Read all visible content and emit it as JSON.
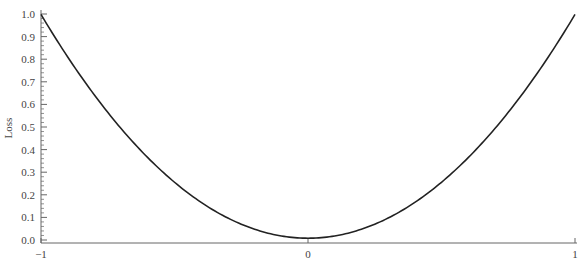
{
  "chart_data": {
    "type": "line",
    "title": "",
    "xlabel": "",
    "ylabel": "Loss",
    "xlim": [
      -1,
      1
    ],
    "ylim": [
      0.0,
      1.0
    ],
    "x_ticks": [
      "−1",
      "0",
      "1"
    ],
    "x_tick_values": [
      -1,
      0,
      1
    ],
    "y_ticks": [
      "0.0",
      "0.1",
      "0.2",
      "0.3",
      "0.4",
      "0.5",
      "0.6",
      "0.7",
      "0.8",
      "0.9",
      "1.0"
    ],
    "y_tick_values": [
      0.0,
      0.1,
      0.2,
      0.3,
      0.4,
      0.5,
      0.6,
      0.7,
      0.8,
      0.9,
      1.0
    ],
    "y_minor_ticks_per_major": 5,
    "grid": false,
    "legend": null,
    "series": [
      {
        "name": "Loss",
        "color": "#222222",
        "function": "x^2",
        "x": [
          -1.0,
          -0.9,
          -0.8,
          -0.7,
          -0.6,
          -0.5,
          -0.4,
          -0.3,
          -0.2,
          -0.1,
          0.0,
          0.1,
          0.2,
          0.3,
          0.4,
          0.5,
          0.6,
          0.7,
          0.8,
          0.9,
          1.0
        ],
        "y": [
          1.0,
          0.81,
          0.64,
          0.49,
          0.36,
          0.25,
          0.16,
          0.09,
          0.04,
          0.01,
          0.0,
          0.01,
          0.04,
          0.09,
          0.16,
          0.25,
          0.36,
          0.49,
          0.64,
          0.81,
          1.0
        ]
      }
    ]
  }
}
